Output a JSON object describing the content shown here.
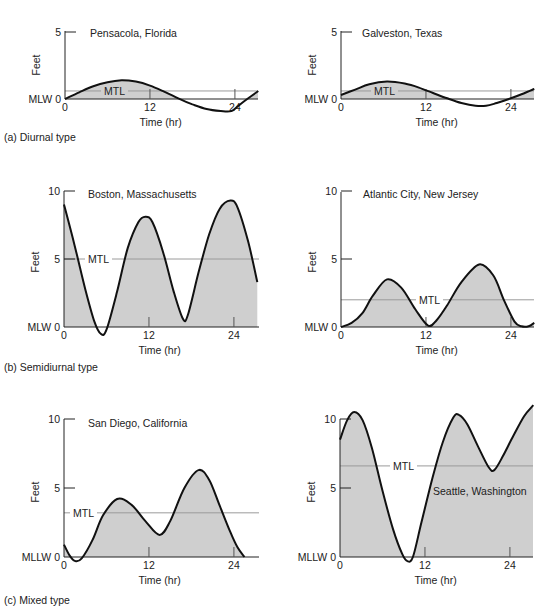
{
  "captions": {
    "a": "(a) Diurnal type",
    "b": "(b) Semidiurnal type",
    "c": "(c) Mixed type"
  },
  "chart_data": [
    {
      "type": "area",
      "id": "pensacola",
      "title": "Pensacola, Florida",
      "group": "(a) Diurnal type",
      "xlabel": "Time (hr)",
      "ylabel": "Feet",
      "datum_label": "MLW",
      "xticks": [
        0,
        12,
        24
      ],
      "yticks": [
        0,
        5
      ],
      "xlim": [
        0,
        27.3
      ],
      "ylim": [
        0,
        5
      ],
      "mtl": 0.6,
      "mtl_label": "MTL",
      "x": [
        0,
        2,
        4,
        6,
        8,
        10,
        12,
        14,
        16,
        18,
        20,
        22,
        23.5,
        24.5,
        25.5,
        27.3
      ],
      "values": [
        0,
        0.5,
        0.95,
        1.25,
        1.4,
        1.3,
        1.0,
        0.55,
        0.05,
        -0.4,
        -0.75,
        -0.9,
        -0.9,
        -0.5,
        -0.1,
        0.6
      ]
    },
    {
      "type": "area",
      "id": "galveston",
      "title": "Galveston, Texas",
      "group": "(a) Diurnal type",
      "xlabel": "Time (hr)",
      "ylabel": "Feet",
      "datum_label": "MLW",
      "xticks": [
        0,
        12,
        24
      ],
      "yticks": [
        0,
        5
      ],
      "xlim": [
        0,
        27.3
      ],
      "ylim": [
        0,
        5
      ],
      "mtl": 0.6,
      "mtl_label": "MTL",
      "x": [
        0,
        2,
        4,
        6.5,
        9,
        11,
        13,
        15,
        17,
        19,
        20.5,
        22,
        24,
        25.5,
        27.3
      ],
      "values": [
        0.3,
        0.7,
        1.1,
        1.3,
        1.15,
        0.85,
        0.45,
        0.05,
        -0.3,
        -0.5,
        -0.5,
        -0.3,
        0.05,
        0.35,
        0.75
      ]
    },
    {
      "type": "area",
      "id": "boston",
      "title": "Boston, Massachusetts",
      "group": "(b) Semidiurnal type",
      "xlabel": "Time (hr)",
      "ylabel": "Feet",
      "datum_label": "MLW",
      "xticks": [
        0,
        12,
        24
      ],
      "yticks": [
        0,
        5,
        10
      ],
      "xlim": [
        0,
        27.3
      ],
      "ylim": [
        0,
        10
      ],
      "mtl": 5,
      "mtl_label": "MTL",
      "x": [
        0,
        1.5,
        3,
        4.3,
        5.2,
        6,
        7.5,
        9,
        10.5,
        11.5,
        12.5,
        14,
        15.5,
        16.8,
        17.5,
        19,
        20.5,
        22,
        23.5,
        24.5,
        26,
        27.3
      ],
      "values": [
        9.0,
        6.0,
        2.8,
        0.4,
        -0.5,
        -0.2,
        2.6,
        5.8,
        7.7,
        8.1,
        7.7,
        5.5,
        2.6,
        0.6,
        0.9,
        4.0,
        6.8,
        8.7,
        9.3,
        8.8,
        6.3,
        3.3
      ]
    },
    {
      "type": "area",
      "id": "atlantic-city",
      "title": "Atlantic City, New Jersey",
      "group": "(b) Semidiurnal type",
      "xlabel": "Time (hr)",
      "ylabel": "Feet",
      "datum_label": "MLW",
      "xticks": [
        0,
        12,
        24
      ],
      "yticks": [
        0,
        5,
        10
      ],
      "xlim": [
        0,
        27.3
      ],
      "ylim": [
        0,
        10
      ],
      "mtl": 2,
      "mtl_label": "MTL",
      "x": [
        0,
        1.5,
        3,
        4.5,
        6.5,
        8.5,
        10.5,
        12.3,
        13.5,
        15,
        17,
        19.5,
        21.5,
        23,
        24.5,
        25.5,
        26.5,
        27.3
      ],
      "values": [
        0,
        0.3,
        1.0,
        2.3,
        3.5,
        2.9,
        1.3,
        0.1,
        0.5,
        1.6,
        3.3,
        4.6,
        3.8,
        2.0,
        0.4,
        0.05,
        0.05,
        0.3
      ]
    },
    {
      "type": "area",
      "id": "san-diego",
      "title": "San Diego, California",
      "group": "(c) Mixed type",
      "xlabel": "Time (hr)",
      "ylabel": "Feet",
      "datum_label": "MLLW",
      "xticks": [
        0,
        12,
        24
      ],
      "yticks": [
        0,
        5,
        10
      ],
      "xlim": [
        0,
        27.3
      ],
      "ylim": [
        0,
        10
      ],
      "mtl": 3.2,
      "mtl_label": "MTL",
      "x": [
        0,
        0.8,
        1.6,
        2.5,
        4,
        5.5,
        7.5,
        9.5,
        11.5,
        13.5,
        15,
        17,
        19,
        20.5,
        22,
        23.5,
        24.5,
        25.5
      ],
      "values": [
        0.9,
        0.1,
        -0.3,
        -0.1,
        1.2,
        3.0,
        4.2,
        3.8,
        2.6,
        1.6,
        2.6,
        5.0,
        6.3,
        5.6,
        3.7,
        1.8,
        0.7,
        0
      ]
    },
    {
      "type": "area",
      "id": "seattle",
      "title": "Seattle, Washington",
      "group": "(c) Mixed type",
      "xlabel": "Time (hr)",
      "ylabel": "Feet",
      "datum_label": "MLLW",
      "xticks": [
        0,
        12,
        24
      ],
      "yticks": [
        0,
        5,
        10
      ],
      "xlim": [
        0,
        27.3
      ],
      "ylim": [
        0,
        10
      ],
      "mtl": 6.6,
      "mtl_label": "MTL",
      "x": [
        0,
        1,
        2,
        3.2,
        4.5,
        6,
        7.5,
        8.8,
        9.5,
        10.3,
        11.5,
        13,
        14.5,
        16,
        16.8,
        18,
        19.5,
        21,
        21.8,
        23,
        24.5,
        26,
        27.3
      ],
      "values": [
        8.5,
        9.9,
        10.5,
        9.9,
        7.9,
        4.8,
        2.0,
        0.2,
        -0.3,
        0.0,
        2.5,
        5.6,
        8.3,
        10.1,
        10.3,
        9.6,
        8.0,
        6.5,
        6.3,
        7.3,
        8.8,
        10.2,
        11.0
      ]
    }
  ],
  "panels_layout": [
    {
      "id": "pensacola",
      "x0": 65,
      "y0": 99,
      "xend": 258,
      "pxPerHr": 7.08,
      "pxPerFt": 13.4,
      "title_x": 90,
      "title_y": 37,
      "mtl_label_x": 104,
      "ylabel_y": 65,
      "axis_top": 31
    },
    {
      "id": "galveston",
      "x0": 341,
      "y0": 99,
      "xend": 534,
      "pxPerHr": 7.08,
      "pxPerFt": 13.4,
      "title_x": 362,
      "title_y": 37,
      "mtl_label_x": 374,
      "ylabel_y": 65,
      "axis_top": 31
    },
    {
      "id": "boston",
      "x0": 64,
      "y0": 327,
      "xend": 259,
      "pxPerHr": 7.08,
      "pxPerFt": 13.6,
      "title_x": 88,
      "title_y": 198,
      "mtl_label_x": 88,
      "ylabel_y": 262,
      "axis_top": 191
    },
    {
      "id": "atlantic-city",
      "x0": 341,
      "y0": 327,
      "xend": 534,
      "pxPerHr": 7.08,
      "pxPerFt": 13.6,
      "title_x": 363,
      "title_y": 198,
      "mtl_label_x": 419,
      "ylabel_y": 262,
      "axis_top": 192
    },
    {
      "id": "san-diego",
      "x0": 64,
      "y0": 557,
      "xend": 259,
      "pxPerHr": 7.08,
      "pxPerFt": 13.8,
      "title_x": 88,
      "title_y": 427,
      "mtl_label_x": 73,
      "ylabel_y": 492,
      "axis_top": 419
    },
    {
      "id": "seattle",
      "x0": 340,
      "y0": 557,
      "xend": 533,
      "pxPerHr": 7.08,
      "pxPerFt": 13.8,
      "title_x": 433,
      "title_y": 495,
      "mtl_label_x": 393,
      "ylabel_y": 492,
      "axis_top": 419
    }
  ],
  "colors": {
    "fill": "#cfcfcf",
    "curve": "#111111",
    "axis": "#222222",
    "mtl_line": "#9a9a9a",
    "text": "#222222"
  }
}
